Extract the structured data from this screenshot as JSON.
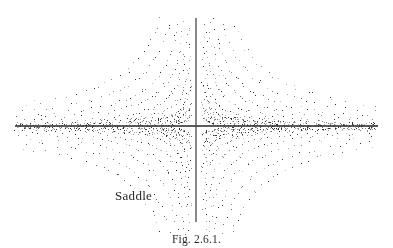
{
  "figure": {
    "label": "Saddle",
    "caption": "Fig. 2.6.1.",
    "background_color": "#ffffff",
    "axis_color": "#333333",
    "dot_color_dark": "#333333",
    "dot_color_light": "#a8a8a8"
  },
  "chart_data": {
    "type": "scatter",
    "title": "Saddle",
    "subtitle": "Fig. 2.6.1.",
    "xlabel": "",
    "ylabel": "",
    "grid": false,
    "legend": null,
    "origin_px": [
      196,
      126
    ],
    "axes": {
      "x_axis": {
        "x_start_px": 15,
        "x_end_px": 378,
        "y_px": 126,
        "thickness_px": 1.6
      },
      "y_axis": {
        "y_start_px": 18,
        "y_end_px": 222,
        "x_px": 196,
        "thickness_px": 1.3
      }
    },
    "xlim": [
      -6.0,
      6.0
    ],
    "ylim": [
      -3.4,
      3.4
    ],
    "trajectory_family": "xy = c (rectangular hyperbolas)",
    "c_levels": [
      0.06,
      0.14,
      0.28,
      0.5,
      0.85,
      1.35,
      2.0,
      2.9,
      4.0
    ],
    "quadrant_signs": [
      [
        1,
        1
      ],
      [
        -1,
        1
      ],
      [
        -1,
        -1
      ],
      [
        1,
        -1
      ]
    ],
    "dots_per_curve": 46,
    "dot_size_px": 1,
    "dot_shade_fractions": [
      0.45,
      0.55
    ],
    "seed": 20601
  }
}
